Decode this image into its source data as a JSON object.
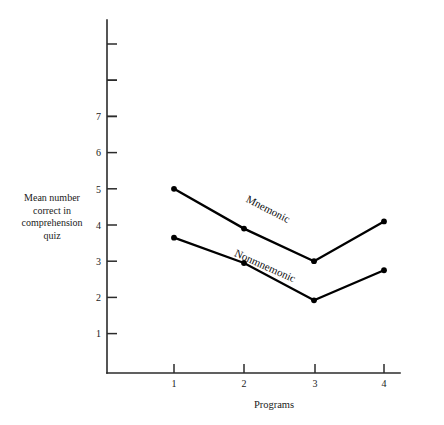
{
  "chart_data": {
    "type": "line",
    "title": "",
    "subtitle": "",
    "xlabel": "Programs",
    "ylabel": "Mean number correct in comprehension quiz",
    "ylabel_lines": [
      "Mean number",
      "correct in",
      "comprehension",
      "quiz"
    ],
    "x": [
      1,
      2,
      3,
      4
    ],
    "categories": [
      "1",
      "2",
      "3",
      "4"
    ],
    "xtick_labels": [
      "1",
      "2",
      "3",
      "4"
    ],
    "ytick_labels": [
      "7",
      "6",
      "5",
      "4",
      "3",
      "2",
      "1"
    ],
    "ytick_values": [
      7,
      6,
      5,
      4,
      3,
      2,
      1
    ],
    "yticks_unlabeled": [
      8,
      9
    ],
    "xlim": [
      0.55,
      4.45
    ],
    "ylim": [
      0,
      9.6
    ],
    "grid": false,
    "legend": "inline-series-labels",
    "legend_position": "along-lines",
    "marker": "filled-circle",
    "series": [
      {
        "name": "Mnemonic",
        "values": [
          5.0,
          3.9,
          3.0,
          4.1
        ],
        "label_x": 2.32,
        "label_y": 4.35
      },
      {
        "name": "Nonmnemonic",
        "values": [
          3.65,
          2.95,
          1.92,
          2.75
        ],
        "label_x": 2.28,
        "label_y": 2.78
      }
    ],
    "colors": {
      "line": "#000000",
      "marker": "#000000",
      "axis": "#2b2b2b",
      "text": "#1a1a1a",
      "background": "#ffffff"
    }
  },
  "axes": {
    "x_title": "Programs",
    "y_title_lines": [
      "Mean number",
      "correct in",
      "comprehension",
      "quiz"
    ]
  },
  "series_labels": {
    "mnemonic": "Mnemonic",
    "nonmnemonic": "Nonmnemonic"
  },
  "ticks": {
    "x": [
      "1",
      "2",
      "3",
      "4"
    ],
    "y": [
      "7",
      "6",
      "5",
      "4",
      "3",
      "2",
      "1"
    ]
  }
}
